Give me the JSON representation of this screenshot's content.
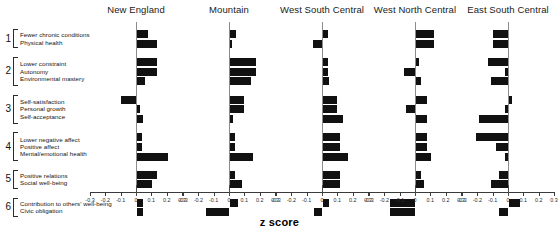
{
  "figure": {
    "xlabel": "z score",
    "tick_labels": [
      "-0.3",
      "-0.2",
      "-0.1",
      "0",
      "0.1",
      "0.2",
      "0.3"
    ],
    "bar_color": "#111111",
    "axis_color": "#3a3a3a",
    "zeroline_color": "#8c8c8c"
  },
  "groups": [
    {
      "number": "1",
      "items": [
        "Fewer chronic conditions",
        "Physical health"
      ]
    },
    {
      "number": "2",
      "items": [
        "Lower constraint",
        "Autonomy",
        "Environmental mastery"
      ]
    },
    {
      "number": "3",
      "items": [
        "Self-satisfaction",
        "Personal growth",
        "Self-acceptance"
      ]
    },
    {
      "number": "4",
      "items": [
        "Lower negative affect",
        "Positive affect",
        "Mental/emotional health"
      ]
    },
    {
      "number": "5",
      "items": [
        "Positive relations",
        "Social well-being"
      ]
    },
    {
      "number": "6",
      "items": [
        "Contribution to others' well-being",
        "Civic obligation"
      ]
    }
  ],
  "chart_data": {
    "type": "bar",
    "orientation": "horizontal",
    "title": "",
    "xlabel": "z score",
    "ylabel": "",
    "xlim": [
      -0.3,
      0.3
    ],
    "xticks": [
      -0.3,
      -0.2,
      -0.1,
      0,
      0.1,
      0.2,
      0.3
    ],
    "grid": false,
    "legend": "none",
    "zero_reference_line": 0,
    "categories": [
      "Fewer chronic conditions",
      "Physical health",
      "Lower constraint",
      "Autonomy",
      "Environmental mastery",
      "Self-satisfaction",
      "Personal growth",
      "Self-acceptance",
      "Lower negative affect",
      "Positive affect",
      "Mental/emotional health",
      "Positive relations",
      "Social well-being",
      "Contribution to others' well-being",
      "Civic obligation"
    ],
    "panels": [
      {
        "name": "New England",
        "values": [
          0.07,
          0.13,
          0.13,
          0.13,
          0.05,
          -0.1,
          0.02,
          0.04,
          0.03,
          0.03,
          0.2,
          0.13,
          0.1,
          0.04,
          0.04
        ]
      },
      {
        "name": "Mountain",
        "values": [
          0.04,
          0.01,
          0.17,
          0.17,
          0.14,
          0.09,
          0.09,
          0.02,
          0.03,
          0.03,
          0.15,
          0.03,
          0.08,
          0.05,
          -0.15
        ]
      },
      {
        "name": "West South Central",
        "values": [
          0.03,
          -0.06,
          0.03,
          0.03,
          0.04,
          0.09,
          0.09,
          0.13,
          0.11,
          0.11,
          0.16,
          0.11,
          0.11,
          0.04,
          -0.05
        ]
      },
      {
        "name": "West North Central",
        "values": [
          0.12,
          0.12,
          0.02,
          -0.07,
          0.03,
          0.07,
          -0.06,
          0.07,
          0.07,
          0.07,
          0.1,
          0.03,
          0.05,
          -0.16,
          -0.16
        ]
      },
      {
        "name": "East South Central",
        "values": [
          -0.1,
          -0.1,
          -0.13,
          -0.02,
          -0.11,
          0.02,
          -0.02,
          -0.19,
          -0.21,
          -0.08,
          -0.02,
          -0.06,
          -0.11,
          0.07,
          -0.06
        ]
      }
    ]
  }
}
